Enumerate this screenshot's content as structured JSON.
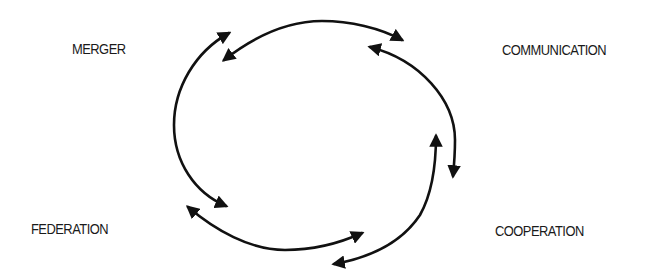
{
  "diagram": {
    "type": "cycle",
    "nodes": {
      "merger": "MERGER",
      "communication": "COMMUNICATION",
      "cooperation": "COOPERATION",
      "federation": "FEDERATION"
    },
    "edges": [
      {
        "from": "merger",
        "to": "communication",
        "direction": "bidirectional"
      },
      {
        "from": "communication",
        "to": "cooperation",
        "direction": "bidirectional"
      },
      {
        "from": "cooperation",
        "to": "federation",
        "direction": "bidirectional"
      },
      {
        "from": "federation",
        "to": "merger",
        "direction": "bidirectional"
      }
    ],
    "colors": {
      "stroke": "#111111",
      "text": "#1a1a1a",
      "background": "#ffffff"
    }
  }
}
